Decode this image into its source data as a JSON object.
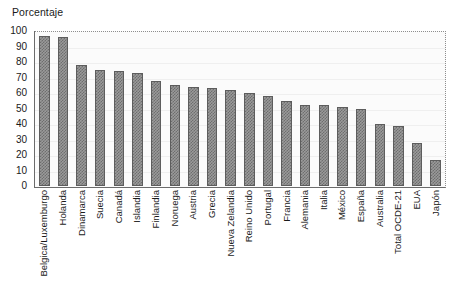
{
  "chart_data": {
    "type": "bar",
    "title": "Porcentaje",
    "xlabel": "",
    "ylabel": "Porcentaje",
    "ylim": [
      0,
      100
    ],
    "yticks": [
      100,
      90,
      80,
      70,
      60,
      50,
      40,
      30,
      20,
      10,
      0
    ],
    "grid": true,
    "legend": "none",
    "categories": [
      "Belgica/Luxemburgo",
      "Holanda",
      "Dinamarca",
      "Suecia",
      "Canadá",
      "Islandia",
      "Finlandia",
      "Noruega",
      "Austria",
      "Grecia",
      "Nueva Zelandia",
      "Reino Unido",
      "Portugal",
      "Francia",
      "Alemania",
      "Italia",
      "México",
      "España",
      "Australia",
      "Total OCDE-21",
      "EUA",
      "Japón"
    ],
    "values": [
      97,
      96,
      78,
      75,
      74,
      73,
      68,
      65,
      64,
      63,
      62,
      60,
      58,
      55,
      52,
      52,
      51,
      50,
      40,
      39,
      28,
      17
    ],
    "bar_color": "#9a9a9a",
    "bar_edge_color": "#5d5d5d",
    "background_color": "#ffffff",
    "plot_background_color": "#fbfbfb"
  }
}
